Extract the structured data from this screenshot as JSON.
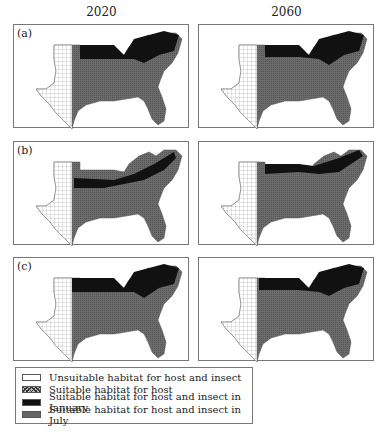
{
  "columns": [
    "2020",
    "2060"
  ],
  "rows": [
    {
      "label": "(a)"
    },
    {
      "label": "(b)"
    },
    {
      "label": "(c)"
    }
  ],
  "legend": [
    {
      "key": "unsuitable",
      "label": "Unsuitable habitat for host and insect",
      "color": "#ffffff"
    },
    {
      "key": "host",
      "label": "Suitable habitat for host",
      "color": "#aaaaaa"
    },
    {
      "key": "january",
      "label": "Suitable habitat for host and insect in January",
      "color": "#111111"
    },
    {
      "key": "july",
      "label": "Suitable habitat for host and insect in July",
      "color": "#666666"
    }
  ],
  "colors": {
    "border": "#777777",
    "july": "#6b6b6b",
    "january": "#111111",
    "grid": "#999999"
  }
}
